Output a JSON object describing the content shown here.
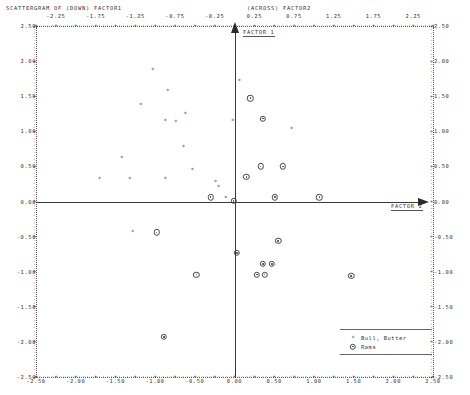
{
  "title": {
    "left": "SCATTERGRAM OF   (DOWN) FACTOR1",
    "right": "(ACROSS) FACTOR2"
  },
  "axes": {
    "vertical_label": "FACTOR 1",
    "horizontal_label": "FACTOR 2"
  },
  "legend": {
    "entries": [
      {
        "symbol": "star-marker",
        "label": "Bull, Butter"
      },
      {
        "symbol": "circle-marker",
        "label": "Rams"
      }
    ]
  },
  "chart_data": {
    "type": "scatter",
    "title": "SCATTERGRAM OF (DOWN) FACTOR1 (ACROSS) FACTOR2",
    "xlabel": "FACTOR 2",
    "ylabel": "FACTOR 1",
    "xlim": [
      -2.5,
      2.5
    ],
    "ylim": [
      -2.5,
      2.5
    ],
    "grid": false,
    "legend_position": "bottom-right",
    "x_ticks_top": [
      "-2.25",
      "-1.75",
      "-1.25",
      "-0.75",
      "-0.25",
      "0.25",
      "0.75",
      "1.25",
      "1.75",
      "2.25"
    ],
    "x_tick_values_top": [
      -2.25,
      -1.75,
      -1.25,
      -0.75,
      -0.25,
      0.25,
      0.75,
      1.25,
      1.75,
      2.25
    ],
    "x_ticks_bottom": [
      "-2.50",
      "-2.00",
      "-1.50",
      "-1.00",
      "-0.50",
      "0.00",
      "0.50",
      "1.00",
      "1.50",
      "2.00",
      "2.50"
    ],
    "x_tick_values_bottom": [
      -2.5,
      -2.0,
      -1.5,
      -1.0,
      -0.5,
      0.0,
      0.5,
      1.0,
      1.5,
      2.0,
      2.5
    ],
    "y_ticks": [
      "2.50",
      "2.00",
      "1.50",
      "1.00",
      "0.50",
      "0.00",
      "-0.50",
      "-1.00",
      "-1.50",
      "-2.00",
      "-2.50"
    ],
    "y_tick_values": [
      2.5,
      2.0,
      1.5,
      1.0,
      0.5,
      0.0,
      -0.5,
      -1.0,
      -1.5,
      -2.0,
      -2.5
    ],
    "series": [
      {
        "name": "Bull, Butter",
        "marker": "star-marker",
        "points": [
          [
            -1.03,
            1.88
          ],
          [
            -0.84,
            1.58
          ],
          [
            -1.18,
            1.37
          ],
          [
            -0.87,
            1.15
          ],
          [
            -0.74,
            1.13
          ],
          [
            -0.62,
            1.25
          ],
          [
            -0.02,
            1.15
          ],
          [
            -1.42,
            0.62
          ],
          [
            -0.53,
            0.45
          ],
          [
            -0.64,
            0.78
          ],
          [
            -1.7,
            0.32
          ],
          [
            -1.32,
            0.32
          ],
          [
            -0.87,
            0.32
          ],
          [
            -0.24,
            0.28
          ],
          [
            -0.2,
            0.2
          ],
          [
            -0.11,
            0.05
          ],
          [
            0.06,
            1.72
          ],
          [
            0.72,
            1.03
          ],
          [
            -1.28,
            -0.44
          ]
        ]
      },
      {
        "name": "Rams",
        "marker": "circle-marker",
        "points": [
          [
            -0.3,
            0.06
          ],
          [
            -0.01,
            0.01
          ],
          [
            0.2,
            1.47
          ],
          [
            0.36,
            1.18
          ],
          [
            0.15,
            0.35
          ],
          [
            0.33,
            0.5
          ],
          [
            0.61,
            0.5
          ],
          [
            0.51,
            0.06
          ],
          [
            1.07,
            0.06
          ],
          [
            -0.98,
            -0.44
          ],
          [
            0.03,
            -0.73
          ],
          [
            0.55,
            -0.56
          ],
          [
            0.36,
            -0.89
          ],
          [
            0.47,
            -0.89
          ],
          [
            0.28,
            -1.04
          ],
          [
            0.38,
            -1.04
          ],
          [
            -0.48,
            -1.04
          ],
          [
            1.47,
            -1.06
          ],
          [
            -0.89,
            -1.93
          ]
        ]
      }
    ]
  }
}
